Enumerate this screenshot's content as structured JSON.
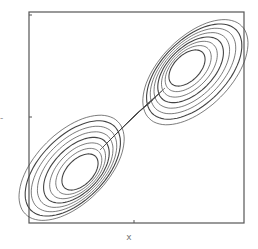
{
  "chart_data": {
    "type": "line",
    "title": "",
    "xlabel": "x",
    "ylabel": "-",
    "grid": false,
    "legend": null,
    "frame": {
      "left": 29,
      "top": 12,
      "right": 244,
      "bottom": 223
    },
    "ticks": {
      "x_mid": 134,
      "y_mid": 117
    },
    "series": [
      {
        "name": "trajectory",
        "color": "#444444",
        "loops_per_lobe": 8
      }
    ]
  },
  "labels": {
    "x_axis": "x",
    "y_axis": "-"
  }
}
